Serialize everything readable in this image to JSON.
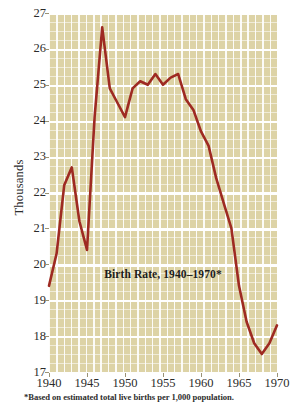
{
  "figure": {
    "footnote": "*Based on estimated total live births per 1,000 population.",
    "colors": {
      "line": "#9e2a22",
      "plot_background": "#ddd3a6",
      "gridline": "#ffffff",
      "text": "#262626",
      "page_background": "#ffffff"
    }
  },
  "chart_data": {
    "type": "line",
    "title": "Birth Rate, 1940–1970*",
    "xlabel": "",
    "ylabel": "Thousands",
    "xlim": [
      1940,
      1970
    ],
    "ylim": [
      17,
      27
    ],
    "grid": true,
    "legend": "none",
    "y_ticks": [
      27,
      26,
      25,
      24,
      23,
      22,
      21,
      20,
      19,
      18,
      17
    ],
    "x_ticks": [
      1940,
      1945,
      1950,
      1955,
      1960,
      1965,
      1970
    ],
    "x_tick_labels": [
      "1940",
      "1945",
      "1950",
      "1955",
      "1960",
      "1965",
      "1970"
    ],
    "y_tick_labels": [
      "27",
      "26",
      "25",
      "24",
      "23",
      "22",
      "21",
      "20",
      "19",
      "18",
      "17"
    ],
    "series": [
      {
        "name": "Birth Rate",
        "color": "#9e2a22",
        "x": [
          1940,
          1941,
          1942,
          1943,
          1944,
          1945,
          1946,
          1947,
          1948,
          1949,
          1950,
          1951,
          1952,
          1953,
          1954,
          1955,
          1956,
          1957,
          1958,
          1959,
          1960,
          1961,
          1962,
          1963,
          1964,
          1965,
          1966,
          1967,
          1968,
          1969,
          1970
        ],
        "values": [
          19.4,
          20.3,
          22.2,
          22.7,
          21.2,
          20.4,
          24.1,
          26.6,
          24.9,
          24.5,
          24.1,
          24.9,
          25.1,
          25.0,
          25.3,
          25.0,
          25.2,
          25.3,
          24.6,
          24.3,
          23.7,
          23.3,
          22.4,
          21.7,
          21.0,
          19.4,
          18.4,
          17.8,
          17.5,
          17.8,
          18.3
        ]
      }
    ]
  }
}
